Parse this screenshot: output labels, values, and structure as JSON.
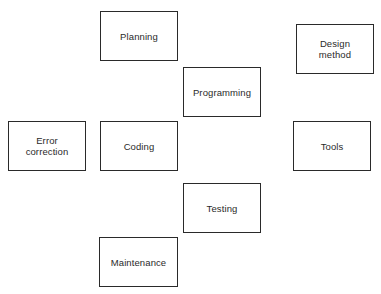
{
  "diagram": {
    "boxes": [
      {
        "id": "planning",
        "label": "Planning",
        "x": 100,
        "y": 11,
        "w": 78,
        "h": 50
      },
      {
        "id": "programming",
        "label": "Programming",
        "x": 183,
        "y": 67,
        "w": 78,
        "h": 50
      },
      {
        "id": "design-method",
        "label": "Design\nmethod",
        "x": 296,
        "y": 24,
        "w": 78,
        "h": 50
      },
      {
        "id": "error-correction",
        "label": "Error\ncorrection",
        "x": 8,
        "y": 121,
        "w": 78,
        "h": 50
      },
      {
        "id": "coding",
        "label": "Coding",
        "x": 100,
        "y": 121,
        "w": 78,
        "h": 50
      },
      {
        "id": "tools",
        "label": "Tools",
        "x": 293,
        "y": 121,
        "w": 78,
        "h": 50
      },
      {
        "id": "testing",
        "label": "Testing",
        "x": 183,
        "y": 183,
        "w": 78,
        "h": 50
      },
      {
        "id": "maintenance",
        "label": "Maintenance",
        "x": 99,
        "y": 237,
        "w": 79,
        "h": 50
      }
    ]
  }
}
